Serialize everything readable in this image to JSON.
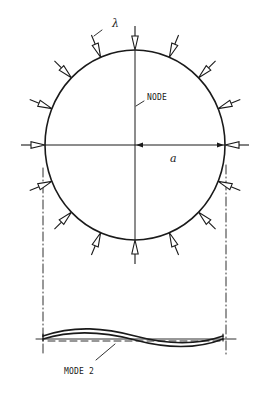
{
  "diagram": {
    "labels": {
      "load_symbol": "λ",
      "node": "NODE",
      "radius": "a",
      "mode": "MODE 2"
    },
    "ring": {
      "cx": 135,
      "cy": 145,
      "rx": 90,
      "ry": 95
    },
    "load_arrow_count": 16,
    "load_arrow_angle_step_deg": 22.5,
    "colors": {
      "ink": "#1a1a1a",
      "background": "#ffffff"
    }
  }
}
